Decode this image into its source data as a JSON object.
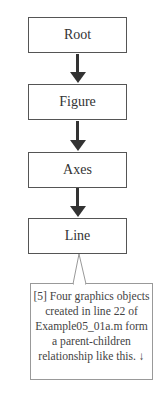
{
  "diagram": {
    "nodes": [
      {
        "id": "root",
        "label": "Root"
      },
      {
        "id": "figure",
        "label": "Figure"
      },
      {
        "id": "axes",
        "label": "Axes"
      },
      {
        "id": "line",
        "label": "Line"
      }
    ],
    "edges": [
      {
        "from": "root",
        "to": "figure"
      },
      {
        "from": "figure",
        "to": "axes"
      },
      {
        "from": "axes",
        "to": "line"
      }
    ],
    "callout": {
      "text": "[5] Four graphics objects created in line 22 of Example05_01a.m form a parent-children relationship like this. ↓",
      "target": "line"
    }
  }
}
